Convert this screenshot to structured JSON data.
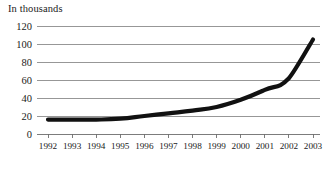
{
  "chart_data": {
    "type": "line",
    "title": "In thousands",
    "xlabel": "",
    "ylabel": "",
    "ylim": [
      0,
      120
    ],
    "ytick_labels": [
      "0",
      "20",
      "40",
      "60",
      "80",
      "100",
      "120"
    ],
    "ytick_values": [
      0,
      20,
      40,
      60,
      80,
      100,
      120
    ],
    "grid": true,
    "legend": "none",
    "categories": [
      "1992",
      "1993",
      "1994",
      "1995",
      "1996",
      "1997",
      "1998",
      "1999",
      "2000",
      "2001",
      "2002",
      "2003"
    ],
    "x": [
      1992,
      1993,
      1994,
      1995,
      1996,
      1997,
      1998,
      1999,
      2000,
      2001,
      2002,
      2003
    ],
    "series": [
      {
        "name": "value",
        "values": [
          16,
          16,
          16,
          17,
          20,
          23,
          26,
          30,
          38,
          49,
          62,
          105
        ]
      }
    ],
    "values": [
      16,
      16,
      16,
      17,
      20,
      23,
      26,
      30,
      38,
      49,
      62,
      105
    ],
    "line_color": "#111111",
    "grid_color": "#8c8c8c",
    "axis_color": "#6e6e6e",
    "background_color": "#ffffff"
  }
}
